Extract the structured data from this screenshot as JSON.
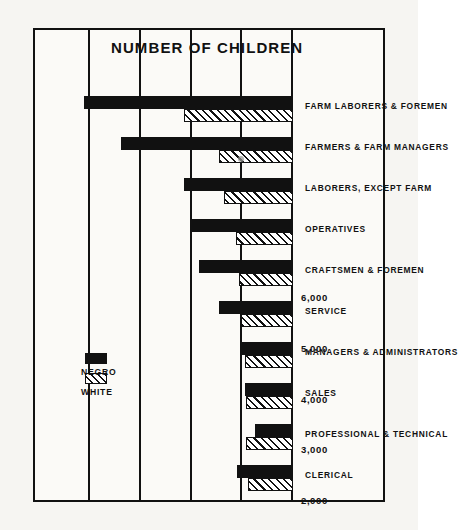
{
  "figure": {
    "orientation": "rotated-90",
    "axis_title": "NUMBER OF CHILDREN",
    "legend": {
      "items": [
        {
          "label": "WHITE",
          "pattern": "diagonal-hatch",
          "color": "#ffffff"
        },
        {
          "label": "NEGRO",
          "pattern": "solid",
          "color": "#111111"
        }
      ]
    },
    "ink_color": "#111111",
    "paper_color": "#fbfaf7"
  },
  "chart_data": {
    "type": "bar",
    "title": "",
    "subtitle": "",
    "xlabel": "",
    "ylabel": "NUMBER OF CHILDREN",
    "orientation": "horizontal",
    "grid": true,
    "legend_position": "inside-upper-left",
    "ylim": [
      2000,
      6500
    ],
    "ticks": [
      2000,
      3000,
      4000,
      5000,
      6000
    ],
    "tick_labels": [
      "2,000",
      "3,000",
      "4,000",
      "5,000",
      "6,000"
    ],
    "categories": [
      "CLERICAL",
      "PROFESSIONAL & TECHNICAL",
      "SALES",
      "MANAGERS & ADMINISTRATORS",
      "SERVICE",
      "CRAFTSMEN & FOREMEN",
      "OPERATIVES",
      "LABORERS, EXCEPT FARM",
      "FARMERS & FARM MANAGERS",
      "FARM LABORERS & FOREMEN"
    ],
    "series": [
      {
        "name": "WHITE",
        "values": [
          2880,
          2920,
          2930,
          2950,
          3020,
          3060,
          3130,
          3360,
          3470,
          4160
        ]
      },
      {
        "name": "NEGRO",
        "values": [
          3100,
          2760,
          2940,
          3010,
          3470,
          3860,
          4010,
          4160,
          5400,
          6120
        ]
      }
    ]
  }
}
